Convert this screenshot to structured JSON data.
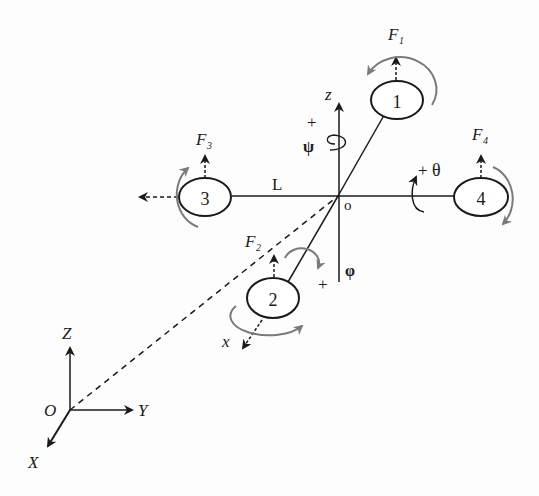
{
  "diagram": {
    "type": "quadrotor-coordinate-frames",
    "colors": {
      "line": "#1a1a1a",
      "rotation_arrow": "#7a7a7a",
      "background": "#fdfdfd"
    },
    "body_frame": {
      "origin_label": "o",
      "z_label": "z",
      "x_label": "x",
      "arm_length_label": "L"
    },
    "rotation_labels": {
      "yaw": {
        "sign": "+",
        "symbol": "ψ"
      },
      "pitch": {
        "sign": "+",
        "symbol": "θ"
      },
      "roll": {
        "sign": "+",
        "symbol": "φ"
      }
    },
    "rotors": [
      {
        "id": "1",
        "number": "1",
        "force_label": "F",
        "force_sub": "1"
      },
      {
        "id": "2",
        "number": "2",
        "force_label": "F",
        "force_sub": "2"
      },
      {
        "id": "3",
        "number": "3",
        "force_label": "F",
        "force_sub": "3"
      },
      {
        "id": "4",
        "number": "4",
        "force_label": "F",
        "force_sub": "4"
      }
    ],
    "inertial_frame": {
      "origin_label": "O",
      "x_label": "X",
      "y_label": "Y",
      "z_label": "Z"
    }
  }
}
